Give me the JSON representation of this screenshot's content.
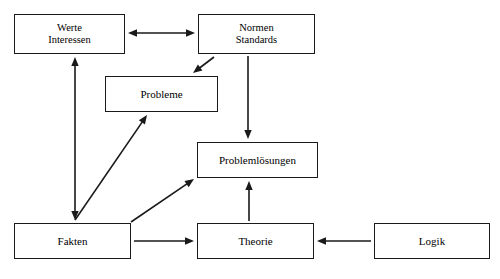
{
  "diagram": {
    "background_color": "#ffffff",
    "stroke_color": "#1a1a1a",
    "text_color": "#000000",
    "nodes": [
      {
        "id": "werte",
        "lines": [
          "Werte",
          "Interessen"
        ],
        "x": 14,
        "y": 14,
        "w": 111,
        "h": 40,
        "font_size": 10.5
      },
      {
        "id": "normen",
        "lines": [
          "Normen",
          "Standards"
        ],
        "x": 198,
        "y": 14,
        "w": 117,
        "h": 40,
        "font_size": 10.5
      },
      {
        "id": "probleme",
        "lines": [
          "Probleme"
        ],
        "x": 105,
        "y": 76,
        "w": 113,
        "h": 36,
        "font_size": 11
      },
      {
        "id": "problemloesungen",
        "lines": [
          "Problemlösungen"
        ],
        "x": 197,
        "y": 142,
        "w": 121,
        "h": 36,
        "font_size": 11
      },
      {
        "id": "fakten",
        "lines": [
          "Fakten"
        ],
        "x": 14,
        "y": 223,
        "w": 117,
        "h": 36,
        "font_size": 11
      },
      {
        "id": "theorie",
        "lines": [
          "Theorie"
        ],
        "x": 197,
        "y": 223,
        "w": 117,
        "h": 36,
        "font_size": 11
      },
      {
        "id": "logik",
        "lines": [
          "Logik"
        ],
        "x": 374,
        "y": 223,
        "w": 116,
        "h": 36,
        "font_size": 11
      }
    ],
    "edges": [
      {
        "id": "werte-normen",
        "from": "werte",
        "to": "normen",
        "direction": "bidirectional",
        "x1": 128,
        "y1": 33,
        "x2": 195,
        "y2": 33
      },
      {
        "id": "normen-probleme",
        "from": "normen",
        "to": "probleme",
        "direction": "unidirectional",
        "x1": 214,
        "y1": 57,
        "x2": 193,
        "y2": 73
      },
      {
        "id": "normen-problemloesungen",
        "from": "normen",
        "to": "problemloesungen",
        "direction": "unidirectional",
        "x1": 248,
        "y1": 56,
        "x2": 248,
        "y2": 139
      },
      {
        "id": "werte-fakten",
        "from": "fakten",
        "to": "werte",
        "direction": "bidirectional",
        "x1": 75,
        "y1": 220,
        "x2": 75,
        "y2": 57
      },
      {
        "id": "fakten-probleme",
        "from": "fakten",
        "to": "probleme",
        "direction": "unidirectional",
        "x1": 75,
        "y1": 220,
        "x2": 147,
        "y2": 115
      },
      {
        "id": "fakten-problemloesungen",
        "from": "fakten",
        "to": "problemloesungen",
        "direction": "unidirectional",
        "x1": 131,
        "y1": 222,
        "x2": 194,
        "y2": 179
      },
      {
        "id": "fakten-theorie",
        "from": "fakten",
        "to": "theorie",
        "direction": "unidirectional",
        "x1": 134,
        "y1": 241,
        "x2": 194,
        "y2": 241
      },
      {
        "id": "theorie-problemloesungen",
        "from": "theorie",
        "to": "problemloesungen",
        "direction": "unidirectional",
        "x1": 249,
        "y1": 221,
        "x2": 249,
        "y2": 181
      },
      {
        "id": "logik-theorie",
        "from": "logik",
        "to": "theorie",
        "direction": "unidirectional",
        "x1": 371,
        "y1": 241,
        "x2": 317,
        "y2": 241
      }
    ]
  }
}
